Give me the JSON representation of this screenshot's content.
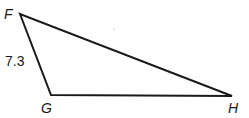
{
  "diagram": {
    "type": "triangle",
    "vertices": [
      {
        "name": "F",
        "x": 20,
        "y": 14
      },
      {
        "name": "G",
        "x": 51,
        "y": 95
      },
      {
        "name": "H",
        "x": 232,
        "y": 96
      }
    ],
    "side_labels": [
      {
        "side": "FG",
        "text": "7.3"
      }
    ],
    "labels": {
      "F": "F",
      "G": "G",
      "H": "H",
      "FG": "7.3"
    },
    "stroke_color": "#1a1a1a"
  }
}
